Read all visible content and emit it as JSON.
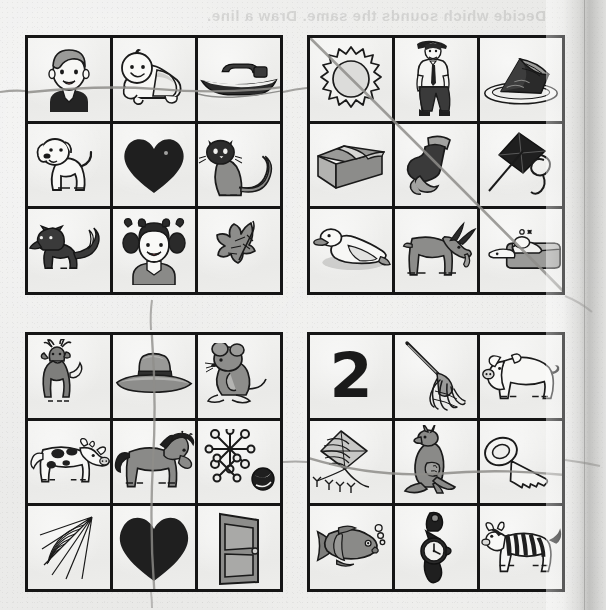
{
  "worksheet": {
    "ghost_heading": "Decide which sounds the same. Draw a line.",
    "background_color": "#eaeae8",
    "ink_color": "#151515",
    "pencil_color": "#8e8d8a",
    "grids": [
      {
        "id": "grid-1",
        "name": "top-left-grid",
        "position": "top-left",
        "mark": {
          "type": "horizontal-line",
          "row": 1,
          "label": "pencil line across row 1"
        },
        "cells": [
          {
            "row": 1,
            "col": 1,
            "icon": "boy-face-icon",
            "label": "boy"
          },
          {
            "row": 1,
            "col": 2,
            "icon": "baby-icon",
            "label": "baby"
          },
          {
            "row": 1,
            "col": 3,
            "icon": "boat-icon",
            "label": "boat"
          },
          {
            "row": 2,
            "col": 1,
            "icon": "dog-icon",
            "label": "dog"
          },
          {
            "row": 2,
            "col": 2,
            "icon": "heart-icon",
            "label": "heart"
          },
          {
            "row": 2,
            "col": 3,
            "icon": "cat-icon",
            "label": "cat"
          },
          {
            "row": 3,
            "col": 1,
            "icon": "fox-icon",
            "label": "fox"
          },
          {
            "row": 3,
            "col": 2,
            "icon": "girl-face-icon",
            "label": "girl"
          },
          {
            "row": 3,
            "col": 3,
            "icon": "leaf-icon",
            "label": "leaf"
          }
        ]
      },
      {
        "id": "grid-2",
        "name": "top-right-grid",
        "position": "top-right",
        "mark": {
          "type": "diagonal-line",
          "label": "pencil line top-left to bottom-right"
        },
        "cells": [
          {
            "row": 1,
            "col": 1,
            "icon": "sun-icon",
            "label": "sun"
          },
          {
            "row": 1,
            "col": 2,
            "icon": "man-icon",
            "label": "man"
          },
          {
            "row": 1,
            "col": 3,
            "icon": "pie-slice-icon",
            "label": "pie"
          },
          {
            "row": 2,
            "col": 1,
            "icon": "box-icon",
            "label": "box"
          },
          {
            "row": 2,
            "col": 2,
            "icon": "sock-icon",
            "label": "sock"
          },
          {
            "row": 2,
            "col": 3,
            "icon": "kite-icon",
            "label": "kite"
          },
          {
            "row": 3,
            "col": 1,
            "icon": "duck-icon",
            "label": "duck"
          },
          {
            "row": 3,
            "col": 2,
            "icon": "goat-icon",
            "label": "goat"
          },
          {
            "row": 3,
            "col": 3,
            "icon": "sleeping-bed-icon",
            "label": "bed"
          }
        ]
      },
      {
        "id": "grid-3",
        "name": "bottom-left-grid",
        "position": "bottom-left",
        "mark": {
          "type": "vertical-line",
          "col": 2,
          "label": "pencil line down column 2"
        },
        "cells": [
          {
            "row": 1,
            "col": 1,
            "icon": "deer-icon",
            "label": "deer"
          },
          {
            "row": 1,
            "col": 2,
            "icon": "hat-icon",
            "label": "hat"
          },
          {
            "row": 1,
            "col": 3,
            "icon": "mouse-icon",
            "label": "mouse"
          },
          {
            "row": 2,
            "col": 1,
            "icon": "cow-icon",
            "label": "cow"
          },
          {
            "row": 2,
            "col": 2,
            "icon": "horse-icon",
            "label": "horse"
          },
          {
            "row": 2,
            "col": 3,
            "icon": "jacks-ball-icon",
            "label": "jacks"
          },
          {
            "row": 3,
            "col": 1,
            "icon": "spider-web-icon",
            "label": "web"
          },
          {
            "row": 3,
            "col": 2,
            "icon": "heart-icon",
            "label": "heart"
          },
          {
            "row": 3,
            "col": 3,
            "icon": "door-icon",
            "label": "door"
          }
        ]
      },
      {
        "id": "grid-4",
        "name": "bottom-right-grid",
        "position": "bottom-right",
        "mark": {
          "type": "horizontal-line",
          "row": 2,
          "label": "pencil line across row 2"
        },
        "cells": [
          {
            "row": 1,
            "col": 1,
            "icon": "number-two-glyph",
            "label": "2",
            "text": "2"
          },
          {
            "row": 1,
            "col": 2,
            "icon": "mop-icon",
            "label": "mop"
          },
          {
            "row": 1,
            "col": 3,
            "icon": "pig-icon",
            "label": "pig"
          },
          {
            "row": 2,
            "col": 1,
            "icon": "kite-icon",
            "label": "kite"
          },
          {
            "row": 2,
            "col": 2,
            "icon": "kangaroo-icon",
            "label": "kangaroo"
          },
          {
            "row": 2,
            "col": 3,
            "icon": "key-icon",
            "label": "key"
          },
          {
            "row": 3,
            "col": 1,
            "icon": "fish-icon",
            "label": "fish"
          },
          {
            "row": 3,
            "col": 2,
            "icon": "watch-icon",
            "label": "watch"
          },
          {
            "row": 3,
            "col": 3,
            "icon": "zebra-icon",
            "label": "zebra"
          }
        ]
      }
    ]
  }
}
